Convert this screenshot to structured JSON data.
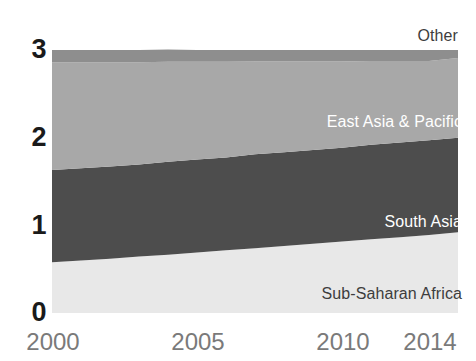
{
  "chart_data": {
    "type": "area",
    "title": "",
    "subtitle": "",
    "xlabel": "",
    "ylabel": "",
    "stacked": true,
    "grid": false,
    "legend_position": "inline-right",
    "x": [
      2000,
      2001,
      2002,
      2003,
      2004,
      2005,
      2006,
      2007,
      2008,
      2009,
      2010,
      2011,
      2012,
      2013,
      2014
    ],
    "xlim": [
      2000,
      2014
    ],
    "ylim": [
      0,
      3
    ],
    "xticks": [
      "2000",
      "2005",
      "2010",
      "2014"
    ],
    "xtick_values": [
      2000,
      2005,
      2010,
      2014
    ],
    "yticks": [
      "0",
      "1",
      "2",
      "3"
    ],
    "ytick_values": [
      0,
      1,
      2,
      3
    ],
    "series": [
      {
        "name": "Sub-Saharan Africa",
        "color": "#e8e8e8",
        "label_color": "#3d3d3d",
        "values": [
          0.58,
          0.6,
          0.62,
          0.645,
          0.665,
          0.69,
          0.715,
          0.74,
          0.765,
          0.79,
          0.815,
          0.84,
          0.865,
          0.89,
          0.92
        ]
      },
      {
        "name": "South Asia",
        "color": "#4d4d4d",
        "label_color": "#ffffff",
        "values": [
          1.05,
          1.05,
          1.05,
          1.05,
          1.06,
          1.06,
          1.06,
          1.07,
          1.07,
          1.07,
          1.07,
          1.08,
          1.08,
          1.08,
          1.08
        ]
      },
      {
        "name": "East Asia & Pacific",
        "color": "#a8a8a8",
        "label_color": "#ffffff",
        "values": [
          1.23,
          1.21,
          1.19,
          1.165,
          1.14,
          1.115,
          1.09,
          1.06,
          1.035,
          1.01,
          0.985,
          0.955,
          0.93,
          0.905,
          0.91
        ]
      },
      {
        "name": "Other",
        "color": "#8e8e8e",
        "label_color": "#3d3d3d",
        "values": [
          0.14,
          0.14,
          0.14,
          0.14,
          0.14,
          0.135,
          0.135,
          0.13,
          0.13,
          0.13,
          0.13,
          0.125,
          0.125,
          0.125,
          0.09
        ]
      }
    ],
    "totals": [
      3.0,
      3.0,
      3.0,
      3.0,
      3.0,
      3.0,
      3.0,
      3.0,
      3.0,
      3.0,
      3.0,
      3.0,
      3.0,
      3.0,
      3.0
    ]
  },
  "axis": {
    "y_ticks": [
      {
        "label": "3"
      },
      {
        "label": "2"
      },
      {
        "label": "1"
      },
      {
        "label": "0"
      }
    ],
    "x_ticks": [
      {
        "label": "2000"
      },
      {
        "label": "2005"
      },
      {
        "label": "2010"
      },
      {
        "label": "2014"
      }
    ]
  },
  "labels": {
    "other": "Other",
    "east_asia_pacific": "East Asia & Pacific",
    "south_asia": "South Asia",
    "sub_saharan_africa": "Sub-Saharan Africa"
  },
  "colors": {
    "background": "#ffffff",
    "sub_saharan_africa": "#e8e8e8",
    "south_asia": "#4d4d4d",
    "east_asia_pacific": "#a8a8a8",
    "other": "#8e8e8e",
    "ytick_text": "#1a1a1a",
    "xtick_text": "#7a7a7a"
  }
}
